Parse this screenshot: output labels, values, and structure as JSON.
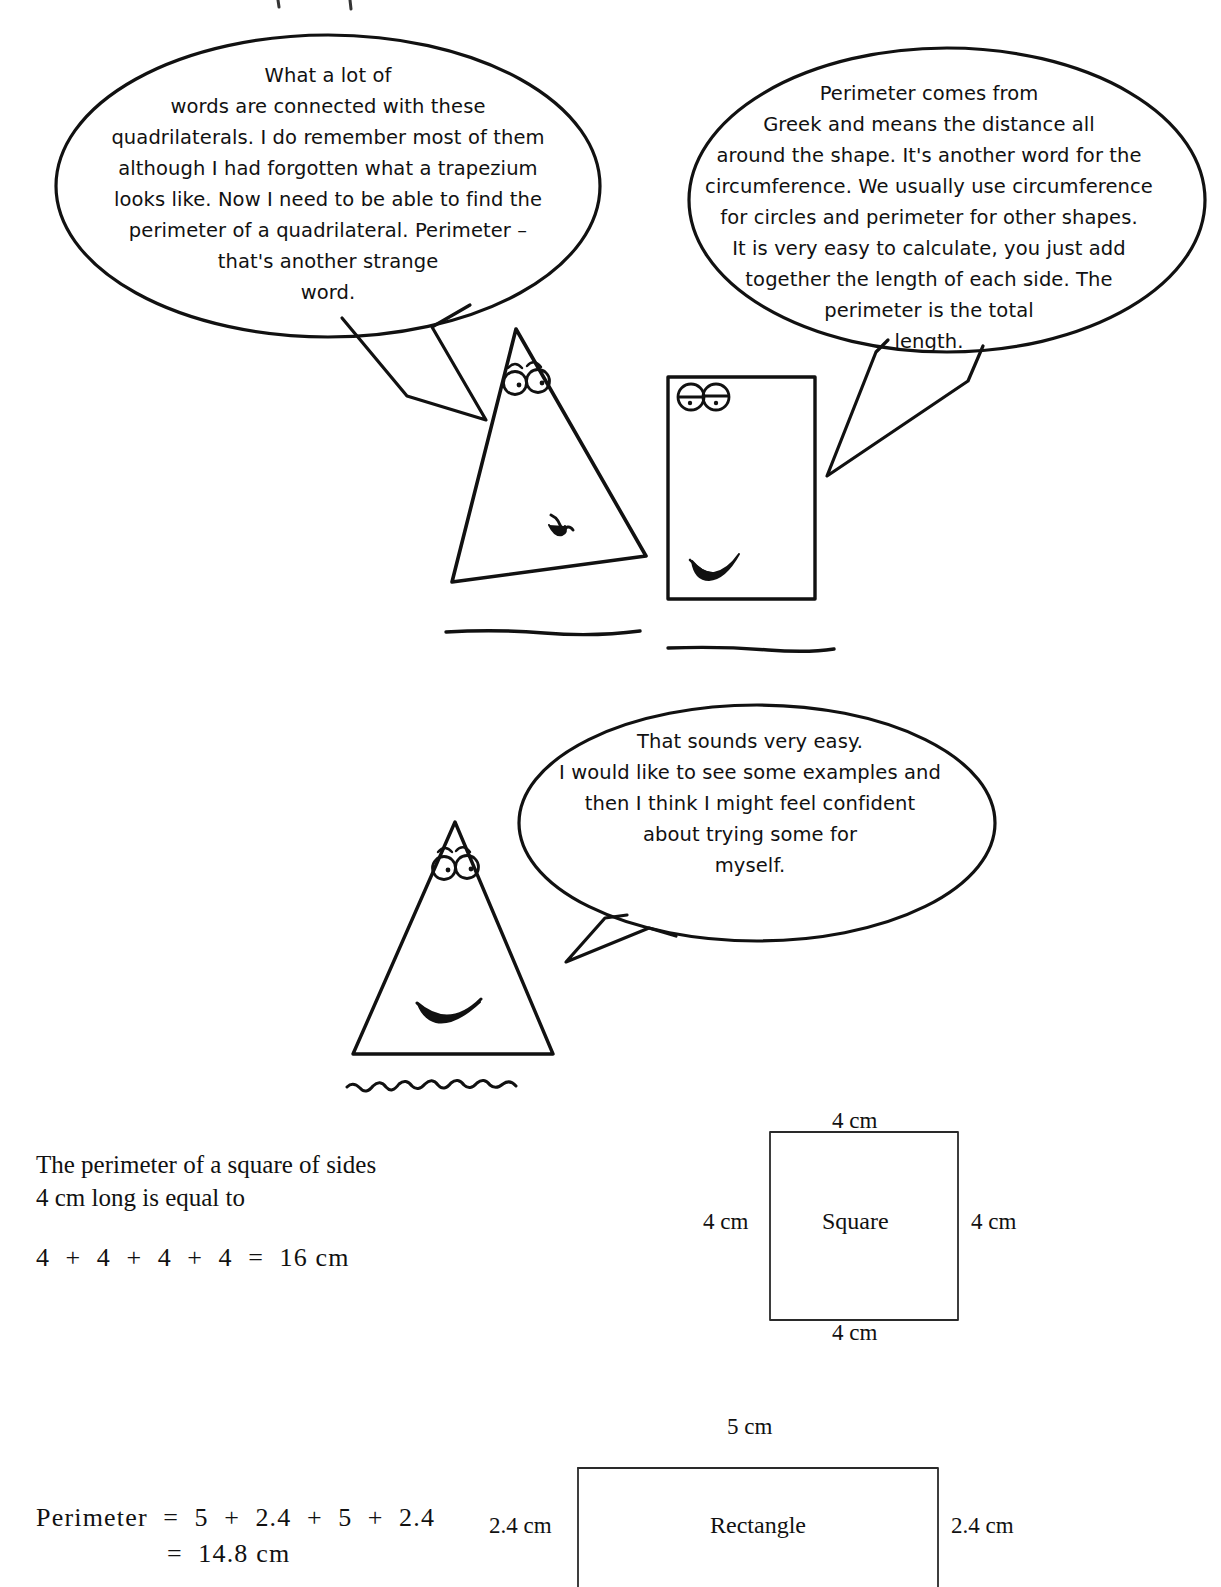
{
  "page": {
    "background_color": "#ffffff",
    "ink_color": "#111111"
  },
  "speech_bubbles": [
    {
      "id": "bubble-1",
      "speaker": "triangle-character-left",
      "text": "What a lot of\nwords are connected with these\nquadrilaterals. I do remember most of them\nalthough I had forgotten what a trapezium\nlooks like. Now I need to be able to find the\nperimeter of a quadrilateral. Perimeter –\nthat's another strange\nword."
    },
    {
      "id": "bubble-2",
      "speaker": "rectangle-character",
      "text": "Perimeter comes from\nGreek and means the distance all\naround the shape. It's another word for the\ncircumference. We usually use circumference\nfor circles and perimeter for other shapes.\nIt is very easy to calculate, you just add\ntogether the length of each side. The\nperimeter is the total\nlength."
    },
    {
      "id": "bubble-3",
      "speaker": "triangle-character-bottom",
      "text": "That sounds very easy.\nI would like to see some examples and\nthen I think I might feel confident\nabout trying some for\nmyself."
    }
  ],
  "characters": [
    {
      "id": "triangle-character-left",
      "shape": "triangle",
      "expression": "neutral"
    },
    {
      "id": "rectangle-character",
      "shape": "rectangle",
      "expression": "grin"
    },
    {
      "id": "triangle-character-bottom",
      "shape": "triangle",
      "expression": "smile"
    }
  ],
  "examples": [
    {
      "id": "square-example",
      "statement": "The perimeter of a square of sides\n4 cm long is equal to",
      "equation": "4  +  4  +  4  +  4  =  16 cm",
      "diagram": {
        "shape_name": "Square",
        "top_label": "4 cm",
        "bottom_label": "4 cm",
        "left_label": "4 cm",
        "right_label": "4 cm"
      }
    },
    {
      "id": "rectangle-example",
      "equation_line1": "Perimeter  =  5  +  2.4  +  5  +  2.4",
      "equation_line2": "=  14.8 cm",
      "diagram": {
        "shape_name": "Rectangle",
        "top_label": "5 cm",
        "left_label": "2.4 cm",
        "right_label": "2.4 cm"
      }
    }
  ]
}
